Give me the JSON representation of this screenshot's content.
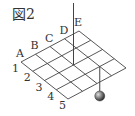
{
  "figure": {
    "title": "図2",
    "column_labels": [
      "A",
      "B",
      "C",
      "D",
      "E"
    ],
    "row_labels": [
      "1",
      "2",
      "3",
      "4",
      "5"
    ],
    "grid": {
      "cells_per_side": 4,
      "origin": [
        21,
        62
      ],
      "u_vector": [
        14.5,
        -7.75
      ],
      "v_vector": [
        11.75,
        9.25
      ]
    },
    "vertical_pole": {
      "grid_point": [
        2,
        2
      ],
      "top_y": 3
    },
    "pendulum": {
      "grid_point": [
        3,
        3
      ],
      "ball_center_y": 96,
      "ball_radius": 5
    },
    "colors": {
      "line": "#444444",
      "text": "#333333",
      "ball": "#555555"
    }
  }
}
